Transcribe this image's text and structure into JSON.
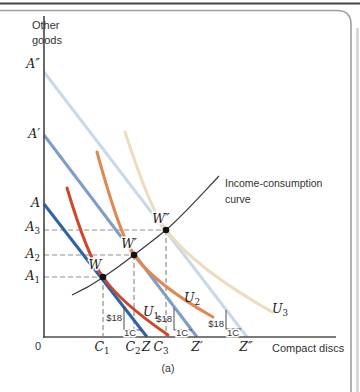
{
  "figure": {
    "caption": "(a)",
    "y_axis_title": {
      "line1": "Other",
      "line2": "goods"
    },
    "x_axis_title": "Compact discs",
    "origin_label": "0",
    "annotation": {
      "line1": "Income-consumption",
      "line2": "curve"
    },
    "y_labels": {
      "a_dblprime": {
        "base": "A″"
      },
      "a_prime": {
        "base": "A′"
      },
      "a": {
        "base": "A"
      },
      "a3": {
        "base": "A",
        "sub": "3"
      },
      "a2": {
        "base": "A",
        "sub": "2"
      },
      "a1": {
        "base": "A",
        "sub": "1"
      }
    },
    "x_labels": {
      "c1": {
        "base": "C",
        "sub": "1"
      },
      "c2": {
        "base": "C",
        "sub": "2"
      },
      "z": {
        "base": "Z"
      },
      "c3": {
        "base": "C",
        "sub": "3"
      },
      "z_prime": {
        "base": "Z′"
      },
      "z_dblprime": {
        "base": "Z″"
      }
    },
    "points": {
      "w": {
        "base": "W"
      },
      "w_prime": {
        "base": "W′"
      },
      "w_dblprime": {
        "base": "W″"
      }
    },
    "utility_curves": {
      "u1": {
        "base": "U",
        "sub": "1"
      },
      "u2": {
        "base": "U",
        "sub": "2"
      },
      "u3": {
        "base": "U",
        "sub": "3"
      }
    },
    "slope": {
      "rise": "$18",
      "run": "1C"
    },
    "colors": {
      "budget_line_a": "#2d62a8",
      "budget_line_a_prime": "#7f9dc7",
      "budget_line_a_dblprime": "#c9d9ea",
      "indifference_u1": "#cf4727",
      "indifference_u2": "#e1884f",
      "indifference_u3": "#eedcbe",
      "income_consumption_curve": "#3a3a3a",
      "axis": "#4f4f4f",
      "dashed": "#8f8f8f",
      "point": "#111111",
      "panel_border": "#9d9d9d",
      "top_rule": "#454545",
      "page_edge": "#cfcfcf"
    }
  }
}
